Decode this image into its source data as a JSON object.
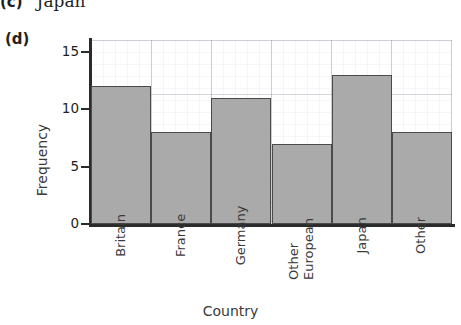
{
  "previous_item": {
    "label": "(c)",
    "text": "Japan"
  },
  "part_label": "(d)",
  "chart_data": {
    "type": "bar",
    "title": "",
    "xlabel": "Country",
    "ylabel": "Frequency",
    "categories": [
      "Britain",
      "France",
      "Germany",
      "Other European",
      "Japan",
      "Other"
    ],
    "category_lines": [
      [
        "Britain"
      ],
      [
        "France"
      ],
      [
        "Germany"
      ],
      [
        "Other",
        "European"
      ],
      [
        "Japan"
      ],
      [
        "Other"
      ]
    ],
    "values": [
      12,
      8,
      11,
      7,
      13,
      8
    ],
    "ylim": [
      0,
      16
    ],
    "yticks": [
      0,
      5,
      10,
      15
    ],
    "ytick_labels": [
      "0",
      "5",
      "10",
      "15"
    ],
    "grid": true,
    "legend": "none",
    "bar_fill_color": "#aaaaaa",
    "bar_edge_color": "#4a4a4a",
    "axis_color": "#2b2b2b",
    "grid_color": "#6e7d8c"
  }
}
